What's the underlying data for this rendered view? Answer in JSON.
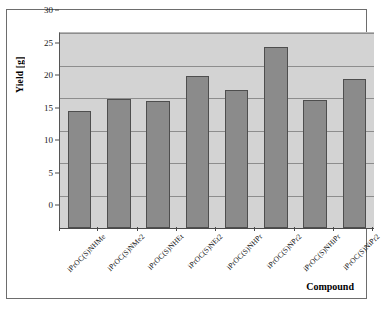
{
  "chart_data": {
    "type": "bar",
    "title": "",
    "xlabel": "Compound",
    "ylabel": "Yield [g]",
    "ylim": [
      0,
      30
    ],
    "ytick_step": 5,
    "yticks": [
      "0",
      "5",
      "10",
      "15",
      "20",
      "25",
      "30"
    ],
    "grid": true,
    "legend": "none",
    "categories": [
      "iPrOC(S)NHMe",
      "iPrOC(S)NMe2",
      "iPrOC(S)NHEt",
      "iPrOC(S)NEt2",
      "iPrOC(S)NHPr",
      "iPrOC(S)NPr2",
      "iPrOC(S)NHiPr",
      "iPrOC(S)NiPr2"
    ],
    "values": [
      18.0,
      19.8,
      19.6,
      23.4,
      21.3,
      27.8,
      19.7,
      22.9
    ],
    "colors": {
      "bar_fill": "#8b8b8b",
      "bar_border": "#4e4e4e",
      "plot_background": "#d3d3d3",
      "gridline": "#8d8d8d",
      "axis": "#4a4a4a",
      "frame_border": "#6d6d6d",
      "figure_background": "#ffffff",
      "text": "#111111"
    }
  }
}
